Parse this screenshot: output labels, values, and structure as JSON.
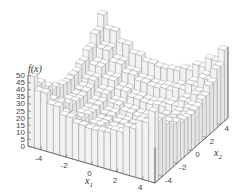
{
  "chart_data": {
    "type": "surface3d",
    "title": "",
    "function": "stepped quadratic (sphere-like) f(x) = floor-quantized x1^2 + x2^2",
    "xlabel": "x1",
    "ylabel": "x2",
    "zlabel": "f(x)",
    "x1_range": [
      -5,
      5
    ],
    "x2_range": [
      -5,
      5
    ],
    "zlim": [
      0,
      50
    ],
    "x1_ticks": [
      "-4",
      "-2",
      "0",
      "2",
      "4"
    ],
    "x2_ticks": [
      "-4",
      "-2",
      "0",
      "2",
      "4"
    ],
    "z_ticks": [
      "0",
      "5",
      "10",
      "15",
      "20",
      "25",
      "30",
      "35",
      "40",
      "45",
      "50"
    ],
    "step": 1,
    "grid": false,
    "legend": "none",
    "colors": {
      "line": "#888888",
      "face": "#ffffff",
      "axis": "#555555"
    }
  },
  "labels": {
    "z": "f(x)",
    "x1": "x",
    "x1_sub": "1",
    "x2": "x",
    "x2_sub": "2"
  }
}
